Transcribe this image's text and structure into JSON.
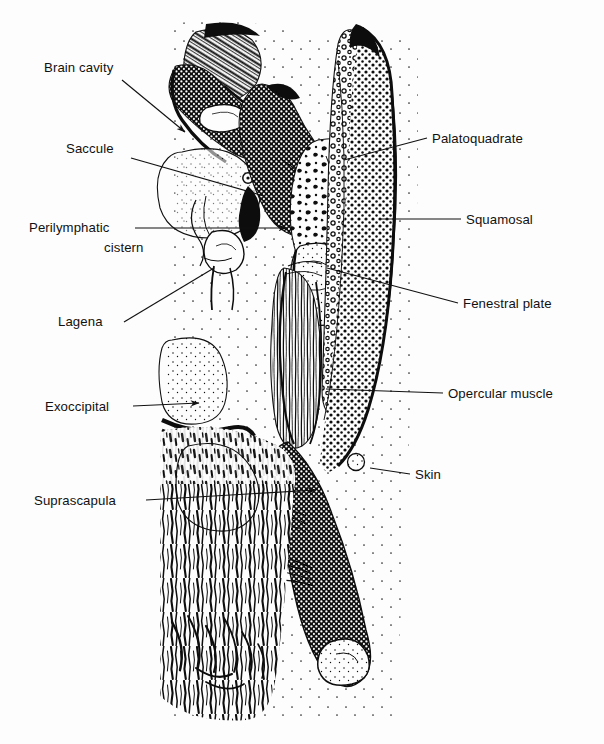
{
  "figure": {
    "kind": "anatomical-line-drawing",
    "background_color": "#fdfdfd",
    "ink_color": "#0d0d0d",
    "text_color": "#111111"
  },
  "labels": [
    {
      "id": "brain-cavity",
      "text": "Brain cavity",
      "side": "left",
      "text_x": 44,
      "text_y": 72,
      "leader": {
        "x1": 122,
        "y1": 80,
        "x2": 185,
        "y2": 132
      },
      "arrow": true
    },
    {
      "id": "saccule",
      "text": "Saccule",
      "side": "left",
      "text_x": 66,
      "text_y": 153,
      "leader": {
        "x1": 131,
        "y1": 158,
        "x2": 264,
        "y2": 196
      },
      "arrow": false
    },
    {
      "id": "perilymphatic-cistern",
      "text": "Perilymphatic",
      "text2": "cistern",
      "side": "left",
      "text_x": 29,
      "text_y": 232,
      "text2_x": 104,
      "text2_y": 252,
      "leader": {
        "x1": 135,
        "y1": 228,
        "x2": 287,
        "y2": 228
      },
      "arrow": true
    },
    {
      "id": "lagena",
      "text": "Lagena",
      "side": "left",
      "text_x": 58,
      "text_y": 326,
      "leader": {
        "x1": 124,
        "y1": 322,
        "x2": 214,
        "y2": 268
      },
      "arrow": false
    },
    {
      "id": "exoccipital",
      "text": "Exoccipital",
      "side": "left",
      "text_x": 45,
      "text_y": 411,
      "leader": {
        "x1": 133,
        "y1": 406,
        "x2": 199,
        "y2": 403
      },
      "arrow": true
    },
    {
      "id": "suprascapula",
      "text": "Suprascapula",
      "side": "left",
      "text_x": 34,
      "text_y": 505,
      "leader": {
        "x1": 146,
        "y1": 500,
        "x2": 316,
        "y2": 490
      },
      "arrow": true
    },
    {
      "id": "palatoquadrate",
      "text": "Palatoquadrate",
      "side": "right",
      "text_x": 432,
      "text_y": 143,
      "leader": {
        "x1": 344,
        "y1": 160,
        "x2": 427,
        "y2": 138
      },
      "arrow": false
    },
    {
      "id": "squamosal",
      "text": "Squamosal",
      "side": "right",
      "text_x": 466,
      "text_y": 224,
      "leader": {
        "x1": 379,
        "y1": 219,
        "x2": 461,
        "y2": 219
      },
      "arrow": false
    },
    {
      "id": "fenestral-plate",
      "text": "Fenestral plate",
      "side": "right",
      "text_x": 463,
      "text_y": 308,
      "leader": {
        "x1": 327,
        "y1": 268,
        "x2": 458,
        "y2": 303
      },
      "arrow": false
    },
    {
      "id": "opercular-muscle",
      "text": "Opercular muscle",
      "side": "right",
      "text_x": 448,
      "text_y": 398,
      "leader": {
        "x1": 326,
        "y1": 389,
        "x2": 443,
        "y2": 393
      },
      "arrow": false
    },
    {
      "id": "skin",
      "text": "Skin",
      "side": "right",
      "text_x": 415,
      "text_y": 479,
      "leader": {
        "x1": 370,
        "y1": 468,
        "x2": 410,
        "y2": 474
      },
      "arrow": false
    }
  ]
}
